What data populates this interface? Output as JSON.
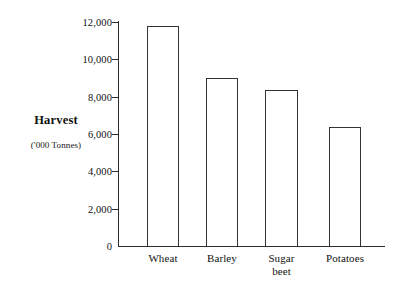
{
  "chart_data": {
    "type": "bar",
    "title": "",
    "subtitle": "",
    "xlabel": "",
    "ylabel": "Harvest",
    "ylabel_units": "('000 Tonnes)",
    "categories": [
      "Wheat",
      "Barley",
      "Sugar beet",
      "Potatoes"
    ],
    "category_lines": [
      [
        "Wheat"
      ],
      [
        "Barley"
      ],
      [
        "Sugar",
        "beet"
      ],
      [
        "Potatoes"
      ]
    ],
    "values": [
      11800,
      9000,
      8350,
      6400
    ],
    "ylim": [
      0,
      12000
    ],
    "ytick_step": 2000,
    "ytick_labels": [
      "12,000",
      "10,000",
      "8,000",
      "6,000",
      "4,000",
      "2,000",
      "0"
    ],
    "ytick_values": [
      12000,
      10000,
      8000,
      6000,
      4000,
      2000,
      0
    ],
    "grid": false,
    "legend": false,
    "legend_position": "none",
    "bar_fill_color": "#ffffff",
    "bar_edge_color": "#333333",
    "axis_color": "#2b2b2b",
    "background_color": "#ffffff",
    "text_color": "#111111"
  },
  "axis_labels": {
    "harvest": "Harvest",
    "units": "('000 Tonnes)"
  }
}
